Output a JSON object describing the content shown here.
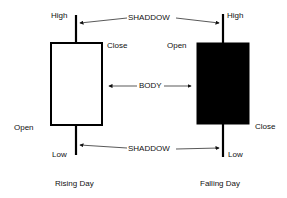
{
  "diagram": {
    "annotations": {
      "shadow_top": "SHADDOW",
      "body": "BODY",
      "shadow_bottom": "SHADDOW"
    },
    "rising": {
      "caption": "Rising Day",
      "high": "High",
      "close": "Close",
      "open": "Open",
      "low": "Low",
      "body_color": "#ffffff"
    },
    "falling": {
      "caption": "Falling Day",
      "high": "High",
      "open": "Open",
      "close": "Close",
      "low": "Low",
      "body_color": "#000000"
    }
  }
}
